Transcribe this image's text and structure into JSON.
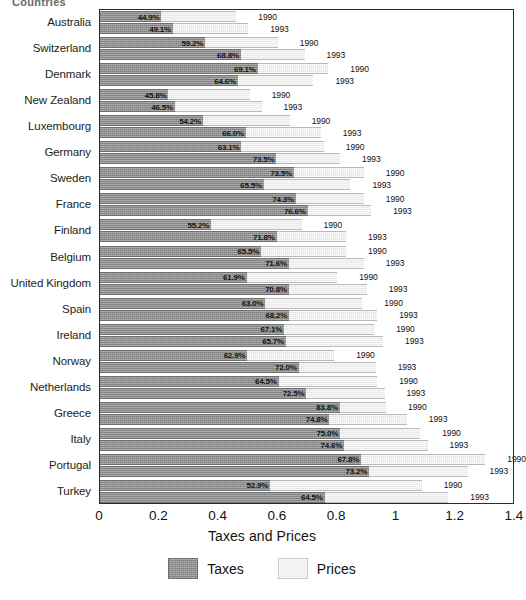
{
  "header": {
    "cutoff_text": "Countries"
  },
  "legend": {
    "position": "bottom-center",
    "entries": [
      {
        "name": "taxes",
        "label": "Taxes",
        "color": "#8d8d8d"
      },
      {
        "name": "prices",
        "label": "Prices",
        "color": "#e8e8e8"
      }
    ]
  },
  "axis": {
    "x_title": "Taxes and Prices",
    "x_ticks": [
      "0",
      "0.2",
      "0.4",
      "0.6",
      "0.8",
      "1",
      "1.2",
      "1.4"
    ],
    "x_min": 0,
    "x_max": 1.4
  },
  "chart_data": {
    "type": "bar",
    "orientation": "horizontal",
    "stacked": false,
    "title": "",
    "subtitle": "",
    "xlabel": "Taxes and Prices",
    "ylabel": "",
    "xlim": [
      0,
      1.4
    ],
    "grid": false,
    "legend_position": "bottom-center",
    "legend_entries": [
      "Taxes",
      "Prices"
    ],
    "note": "Each country has two bars: year 1990 and year 1993. Each bar total length = Price (Taxes and Prices index). The dark inner segment is the Tax share, labelled as a percentage of the total bar.",
    "categories": [
      "Australia",
      "Switzerland",
      "Denmark",
      "New Zealand",
      "Luxembourg",
      "Germany",
      "Sweden",
      "France",
      "Finland",
      "Belgium",
      "United Kingdom",
      "Spain",
      "Ireland",
      "Norway",
      "Netherlands",
      "Greece",
      "Italy",
      "Portugal",
      "Turkey"
    ],
    "series": [
      {
        "name": "1990",
        "year": "1990",
        "totals": [
          0.46,
          0.6,
          0.77,
          0.505,
          0.64,
          0.755,
          0.89,
          0.89,
          0.68,
          0.83,
          0.8,
          0.885,
          0.925,
          0.79,
          0.935,
          0.965,
          1.08,
          1.3,
          1.085
        ],
        "tax_pct": [
          "44.9%",
          "59.2%",
          "69.1%",
          "45.8%",
          "54.2%",
          "63.1%",
          "73.5%",
          "74.3%",
          "55.2%",
          "65.5%",
          "61.9%",
          "63.0%",
          "67.1%",
          "62.9%",
          "64.5%",
          "83.8%",
          "75.0%",
          "67.8%",
          "52.9%"
        ],
        "tax_values": [
          0.207,
          0.355,
          0.532,
          0.231,
          0.347,
          0.477,
          0.654,
          0.661,
          0.375,
          0.544,
          0.495,
          0.558,
          0.621,
          0.497,
          0.603,
          0.809,
          0.81,
          0.881,
          0.574
        ]
      },
      {
        "name": "1993",
        "year": "1993",
        "totals": [
          0.5,
          0.69,
          0.72,
          0.545,
          0.745,
          0.81,
          0.845,
          0.915,
          0.83,
          0.89,
          0.9,
          0.935,
          0.955,
          0.93,
          0.96,
          1.035,
          1.105,
          1.24,
          1.175
        ],
        "tax_pct": [
          "49.1%",
          "68.8%",
          "64.6%",
          "46.5%",
          "66.0%",
          "73.5%",
          "65.5%",
          "76.6%",
          "71.8%",
          "71.6%",
          "70.8%",
          "68.2%",
          "65.7%",
          "72.0%",
          "72.5%",
          "74.8%",
          "74.6%",
          "73.2%",
          "64.5%"
        ],
        "tax_values": [
          0.246,
          0.475,
          0.465,
          0.253,
          0.492,
          0.595,
          0.553,
          0.701,
          0.596,
          0.637,
          0.637,
          0.638,
          0.627,
          0.67,
          0.696,
          0.774,
          0.824,
          0.908,
          0.758
        ]
      }
    ]
  }
}
